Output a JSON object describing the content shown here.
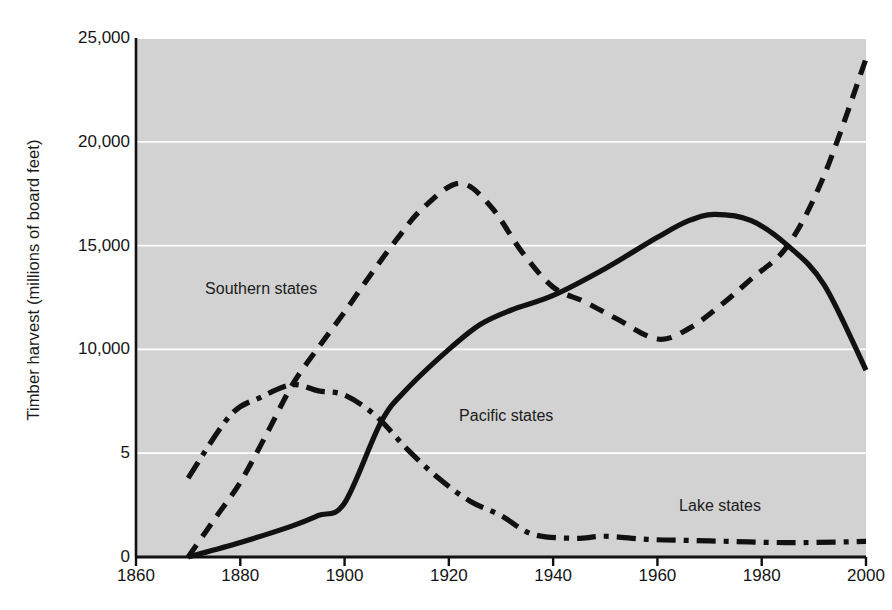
{
  "chart_data": {
    "type": "line",
    "title": "",
    "xlabel": "",
    "ylabel": "Timber harvest (millions of board feet)",
    "xlim": [
      1860,
      2000
    ],
    "ylim": [
      0,
      25000
    ],
    "grid": true,
    "grid_axis": "y",
    "legend": "inline-annotations",
    "xticks": [
      1860,
      1880,
      1900,
      1920,
      1940,
      1960,
      1980,
      2000
    ],
    "xtick_labels": [
      "1860",
      "1880",
      "1900",
      "1920",
      "1940",
      "1960",
      "1980",
      "2000"
    ],
    "yticks": [
      0,
      5000,
      10000,
      15000,
      20000,
      25000
    ],
    "ytick_labels": [
      "0",
      "5",
      "10,000",
      "15,000",
      "20,000",
      "25,000"
    ],
    "series": [
      {
        "name": "Southern states",
        "style": "dashed",
        "color": "#111111",
        "label_x": 1884,
        "label_y": 12900,
        "x": [
          1870,
          1875,
          1880,
          1885,
          1890,
          1895,
          1900,
          1905,
          1910,
          1915,
          1922,
          1928,
          1934,
          1940,
          1946,
          1952,
          1960,
          1966,
          1972,
          1978,
          1985,
          1992,
          2000
        ],
        "y": [
          0,
          1800,
          3600,
          5900,
          8300,
          10100,
          11800,
          13600,
          15300,
          16800,
          18000,
          16900,
          14700,
          13000,
          12300,
          11500,
          10500,
          11000,
          12100,
          13400,
          15000,
          18400,
          24000
        ]
      },
      {
        "name": "Pacific states",
        "style": "solid",
        "color": "#111111",
        "label_x": 1931,
        "label_y": 6800,
        "x": [
          1870,
          1880,
          1890,
          1895,
          1900,
          1907,
          1912,
          1920,
          1926,
          1932,
          1940,
          1950,
          1960,
          1966,
          1971,
          1978,
          1985,
          1992,
          2000
        ],
        "y": [
          0,
          700,
          1500,
          2000,
          2600,
          6500,
          8100,
          10000,
          11200,
          11900,
          12600,
          13900,
          15400,
          16200,
          16500,
          16200,
          15000,
          13100,
          9000
        ]
      },
      {
        "name": "Lake states",
        "style": "dash-dot",
        "color": "#111111",
        "label_x": 1972,
        "label_y": 2450,
        "x": [
          1870,
          1878,
          1884,
          1890,
          1895,
          1900,
          1906,
          1912,
          1918,
          1924,
          1930,
          1936,
          1944,
          1950,
          1958,
          1966,
          1974,
          1982,
          1990,
          2000
        ],
        "y": [
          3800,
          6800,
          7700,
          8300,
          8000,
          7800,
          6800,
          5200,
          3800,
          2700,
          2000,
          1100,
          900,
          1000,
          850,
          800,
          750,
          700,
          700,
          750
        ]
      }
    ]
  },
  "axes": {
    "plot_bg_color": "#d2d2d2",
    "gridline_color": "#ffffff",
    "axis_line_color": "#111111"
  }
}
